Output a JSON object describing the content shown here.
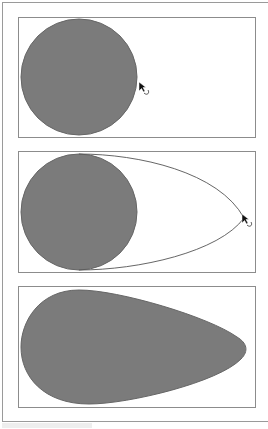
{
  "figure": {
    "fill_color": "#7b7b7b",
    "stroke_color": "#555555",
    "panels": [
      {
        "step": 1,
        "label": "circle with cursor at right edge",
        "cursor": "arrow-with-curve-cursor"
      },
      {
        "step": 2,
        "label": "dragging point outward, preview outline",
        "cursor": "arrow-with-curve-cursor"
      },
      {
        "step": 3,
        "label": "resulting teardrop shape",
        "cursor": ""
      }
    ]
  }
}
